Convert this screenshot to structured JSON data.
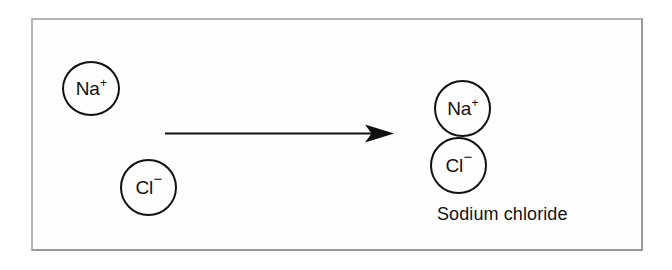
{
  "figure": {
    "background_color": "#fefefe",
    "frame_color": "#b4b4b4",
    "ink_color": "#111111",
    "reactants": [
      {
        "name": "sodium-ion",
        "symbol": "Na",
        "charge": "+",
        "charge_sign": "positive"
      },
      {
        "name": "chloride-ion",
        "symbol": "Cl",
        "charge": "−",
        "charge_sign": "negative"
      }
    ],
    "arrow": {
      "name": "reaction-arrow",
      "direction": "right",
      "style": "solid-line-filled-head"
    },
    "products": [
      {
        "name": "sodium-ion",
        "symbol": "Na",
        "charge": "+",
        "charge_sign": "positive"
      },
      {
        "name": "chloride-ion",
        "symbol": "Cl",
        "charge": "−",
        "charge_sign": "negative"
      }
    ],
    "product_label": "Sodium chloride"
  }
}
